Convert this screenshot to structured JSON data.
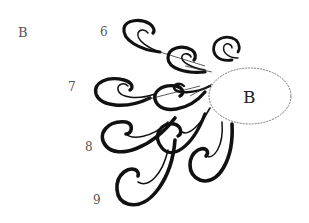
{
  "diagram": {
    "corner_label": "B",
    "row_labels": [
      "6",
      "7",
      "8",
      "9"
    ],
    "center_node": {
      "label": "B",
      "shape": "ellipse"
    },
    "figure": "Curling comma-shaped brush strokes radiating from an ellipse labeled B, arranged in rows 6 through 9"
  }
}
